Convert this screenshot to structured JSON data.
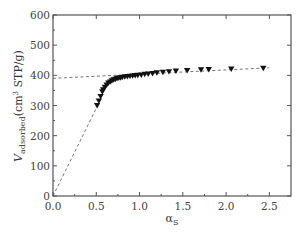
{
  "chart_data": {
    "type": "scatter",
    "title": "",
    "xlabel": "αS",
    "xlabel_main": "α",
    "xlabel_sub": "S",
    "ylabel": "Vadsorbed (cm3 STP/g)",
    "ylabel_main": "V",
    "ylabel_sub": "adsorbed",
    "ylabel_unit_pre": "(cm",
    "ylabel_unit_sup": "3",
    "ylabel_unit_post": " STP/g)",
    "xlim": [
      0.0,
      2.75
    ],
    "ylim": [
      0,
      600
    ],
    "xticks": [
      "0.0",
      "0.5",
      "1.0",
      "1.5",
      "2.0",
      "2.5"
    ],
    "yticks": [
      "0",
      "100",
      "200",
      "300",
      "400",
      "500",
      "600"
    ],
    "grid": false,
    "marker": "downward-triangle",
    "series": [
      {
        "name": "adsorption data",
        "x": [
          0.51,
          0.53,
          0.55,
          0.57,
          0.58,
          0.6,
          0.62,
          0.64,
          0.66,
          0.68,
          0.7,
          0.72,
          0.74,
          0.76,
          0.78,
          0.8,
          0.83,
          0.86,
          0.89,
          0.92,
          0.95,
          0.98,
          1.02,
          1.06,
          1.1,
          1.15,
          1.2,
          1.27,
          1.34,
          1.42,
          1.55,
          1.71,
          1.8,
          2.06,
          2.43
        ],
        "y": [
          300,
          315,
          330,
          345,
          352,
          360,
          368,
          374,
          378,
          382,
          385,
          387,
          389,
          391,
          392,
          393,
          395,
          396,
          397,
          398,
          399,
          400,
          401,
          403,
          404,
          406,
          408,
          410,
          412,
          414,
          416,
          418,
          419,
          421,
          423
        ]
      }
    ],
    "lines": [
      {
        "name": "linear fit (high αS)",
        "style": "dashed",
        "x": [
          0.0,
          2.5
        ],
        "y": [
          390,
          425
        ]
      },
      {
        "name": "linear fit (low αS, through origin)",
        "style": "dashed",
        "x": [
          0.0,
          0.55
        ],
        "y": [
          0,
          320
        ]
      }
    ]
  }
}
